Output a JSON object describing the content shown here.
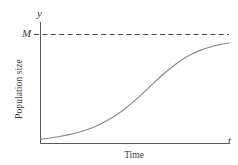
{
  "figure": {
    "kind": "logistic-growth-curve",
    "background_color": "#ffffff",
    "axis_color": "#585858",
    "curve_color": "#8a8a8a",
    "asymptote_color": "#4a4a4a",
    "text_color": "#3b3b3b"
  },
  "labels": {
    "y_axis_variable": "y",
    "x_axis_variable": "t",
    "carrying_capacity": "M",
    "y_axis_title": "Population size",
    "x_axis_title": "Time"
  },
  "chart_data": {
    "type": "line",
    "title": "",
    "subtitle": "",
    "xlabel": "Time",
    "ylabel": "Population size",
    "grid": false,
    "legend": null,
    "xlim": [
      0,
      1
    ],
    "ylim": [
      0,
      1
    ],
    "tick_labels": {
      "x": [],
      "y": [
        "M"
      ]
    },
    "annotations": [
      {
        "text": "y",
        "role": "y-axis-variable",
        "position": "axis-top"
      },
      {
        "text": "t",
        "role": "x-axis-variable",
        "position": "axis-right"
      },
      {
        "text": "M",
        "role": "carrying-capacity-level",
        "position": "y-axis-tick",
        "value": 1.0
      }
    ],
    "reference_lines": [
      {
        "text": "M",
        "orientation": "horizontal",
        "value": 1.0,
        "style": "dashed"
      }
    ],
    "series": [
      {
        "name": "Population size",
        "style": "solid",
        "x": [
          0.0,
          0.05,
          0.1,
          0.15,
          0.2,
          0.25,
          0.3,
          0.35,
          0.4,
          0.45,
          0.5,
          0.55,
          0.6,
          0.65,
          0.7,
          0.75,
          0.8,
          0.85,
          0.9,
          0.95,
          1.0
        ],
        "values": [
          0.04,
          0.05,
          0.064,
          0.081,
          0.103,
          0.131,
          0.166,
          0.209,
          0.262,
          0.324,
          0.396,
          0.474,
          0.556,
          0.635,
          0.707,
          0.769,
          0.819,
          0.857,
          0.886,
          0.907,
          0.922
        ]
      }
    ]
  }
}
